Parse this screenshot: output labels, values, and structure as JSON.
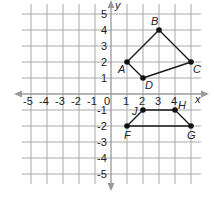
{
  "graph": {
    "x_axis_label": "x",
    "y_axis_label": "y",
    "x_range": [
      -5,
      5
    ],
    "y_range": [
      -5,
      5
    ],
    "x_tick_labels": [
      "-5",
      "-4",
      "-3",
      "-2",
      "-1",
      "0",
      "1",
      "2",
      "3",
      "4"
    ],
    "y_tick_labels": [
      "5",
      "4",
      "3",
      "2",
      "1",
      "-1",
      "-2",
      "-3",
      "-4",
      "-5"
    ],
    "grid": true,
    "colors": {
      "grid": "#a8a8a8",
      "axis": "#9a9a9a",
      "shape": "#1a1a1a",
      "background": "#ffffff"
    }
  },
  "shapes": [
    {
      "name": "quadrilateral ABCD",
      "points": [
        {
          "label": "A",
          "x": 1,
          "y": 2
        },
        {
          "label": "B",
          "x": 3,
          "y": 4
        },
        {
          "label": "C",
          "x": 5,
          "y": 2
        },
        {
          "label": "D",
          "x": 2,
          "y": 1
        }
      ]
    },
    {
      "name": "quadrilateral FJHG",
      "points": [
        {
          "label": "F",
          "x": 1,
          "y": -2
        },
        {
          "label": "J",
          "x": 2,
          "y": -1
        },
        {
          "label": "H",
          "x": 4,
          "y": -1
        },
        {
          "label": "G",
          "x": 5,
          "y": -2
        }
      ]
    }
  ]
}
